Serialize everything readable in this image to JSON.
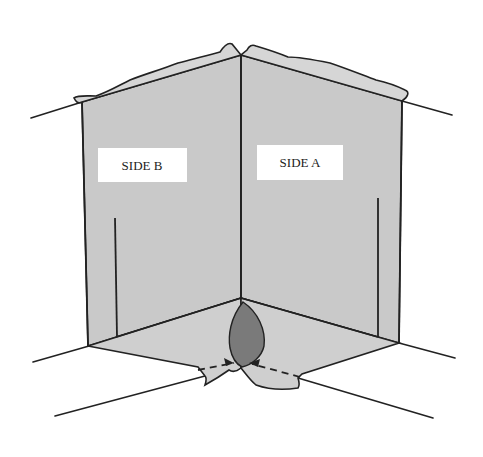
{
  "diagram": {
    "title": "",
    "labels": {
      "side_b": "SIDE B",
      "side_a": "SIDE A"
    },
    "colors": {
      "wall_fill": "#c9c9c9",
      "patch_fill": "#7a7a7a",
      "line": "#222222",
      "background": "#ffffff"
    },
    "elements": [
      "inside corner of two walls (Side B left, Side A right)",
      "torn top flaps of material over wall tops",
      "floor flaps folded out at base",
      "dark repair patch at bottom of inside corner",
      "two dashed arrows pointing to the base of the corner"
    ]
  }
}
